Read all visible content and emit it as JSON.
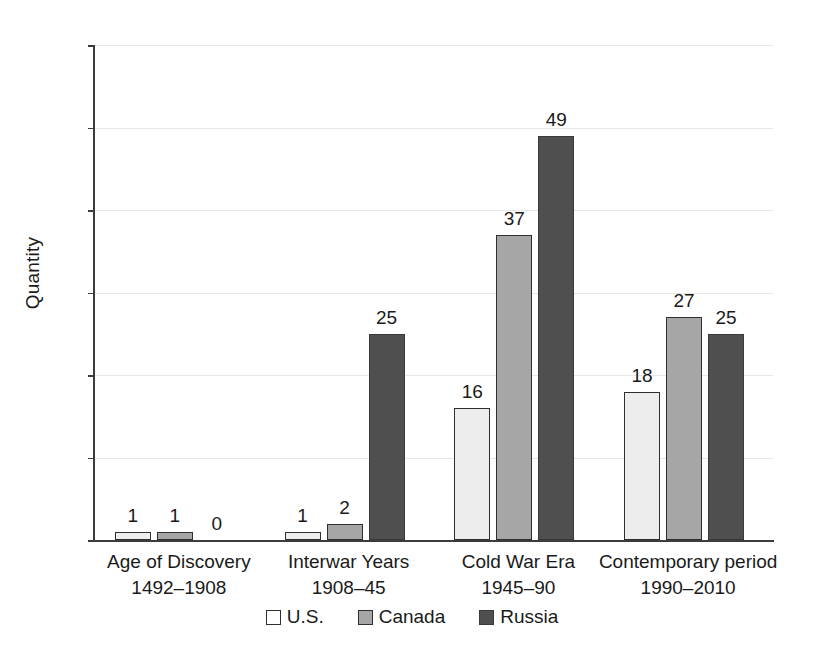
{
  "chart_data": {
    "type": "bar",
    "title": "",
    "xlabel": "",
    "ylabel": "Quantity",
    "ylim": [
      0,
      60
    ],
    "ytick_step": 10,
    "yticks": [
      0,
      10,
      20,
      30,
      40,
      50,
      60
    ],
    "ytick_labels": [
      "0",
      "10",
      "20",
      "30",
      "40",
      "50",
      "60"
    ],
    "grid": "horizontal",
    "legend_position": "bottom-center",
    "data_labels": true,
    "categories": [
      "Age of Discovery",
      "Interwar Years",
      "Cold War Era",
      "Contemporary period"
    ],
    "category_subtitles": [
      "1492–1908",
      "1908–45",
      "1945–90",
      "1990–2010"
    ],
    "series": [
      {
        "name": "U.S.",
        "color": "#ededed",
        "values": [
          1,
          1,
          16,
          18
        ]
      },
      {
        "name": "Canada",
        "color": "#a6a6a6",
        "values": [
          1,
          2,
          37,
          27
        ]
      },
      {
        "name": "Russia",
        "color": "#4f4f4f",
        "values": [
          0,
          25,
          49,
          25
        ]
      }
    ]
  },
  "axis": {
    "y_title": "Quantity"
  },
  "legend": {
    "items": [
      {
        "label": "U.S.",
        "swatch": "legend-swatch-us"
      },
      {
        "label": "Canada",
        "swatch": "legend-swatch-canada"
      },
      {
        "label": "Russia",
        "swatch": "legend-swatch-russia"
      }
    ]
  },
  "colors": {
    "us": "#ededed",
    "canada": "#a6a6a6",
    "russia": "#4f4f4f",
    "axis": "#3c3c3c",
    "grid": "#e8e8e8",
    "text": "#1a1a1a",
    "background": "#ffffff"
  }
}
